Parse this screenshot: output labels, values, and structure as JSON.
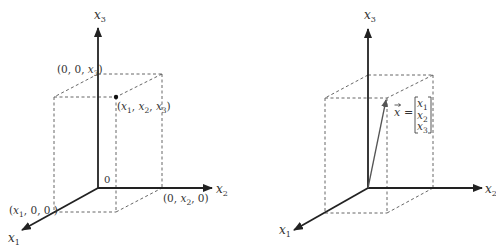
{
  "left_figure": {
    "axes": {
      "x1": {
        "name": "x",
        "sub": "1"
      },
      "x2": {
        "name": "x",
        "sub": "2"
      },
      "x3": {
        "name": "x",
        "sub": "3"
      }
    },
    "origin_label": "0",
    "point_labels": {
      "p_x3": {
        "open": "(0, 0, ",
        "var": "x",
        "sub": "3",
        "close": ")"
      },
      "p_x2": {
        "open": "(0, ",
        "var": "x",
        "sub": "2",
        "close": ", 0)"
      },
      "p_x1": {
        "open": "(",
        "var": "x",
        "sub": "1",
        "close": ", 0, 0 )"
      },
      "p_main": {
        "a": "(",
        "v1": "x",
        "s1": "1",
        "c1": ", ",
        "v2": "x",
        "s2": "2",
        "c2": ", ",
        "v3": "x",
        "s3": "3",
        "close": ")"
      }
    }
  },
  "right_figure": {
    "axes": {
      "x1": {
        "name": "x",
        "sub": "1"
      },
      "x2": {
        "name": "x",
        "sub": "2"
      },
      "x3": {
        "name": "x",
        "sub": "3"
      }
    },
    "vector_label": {
      "lhs": "x",
      "arrow": "⃗",
      "equals": "=",
      "entries": [
        {
          "var": "x",
          "sub": "1"
        },
        {
          "var": "x",
          "sub": "2"
        },
        {
          "var": "x",
          "sub": "3"
        }
      ]
    }
  },
  "colors": {
    "axis": "#222222",
    "dashed": "#555555",
    "vector": "#555555",
    "text": "#333333"
  }
}
